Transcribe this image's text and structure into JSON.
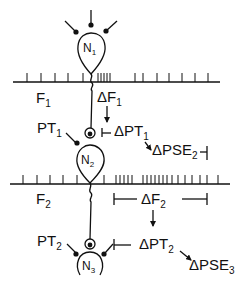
{
  "diagram": {
    "neurons": [
      {
        "id": "N1",
        "letter": "N",
        "sub": "1"
      },
      {
        "id": "N2",
        "letter": "N",
        "sub": "2"
      },
      {
        "id": "N3",
        "letter": "N",
        "sub": "3"
      }
    ],
    "fibers": [
      {
        "id": "F1",
        "letter": "F",
        "sub": "1"
      },
      {
        "id": "F2",
        "letter": "F",
        "sub": "2"
      }
    ],
    "labels": {
      "dF1": {
        "prefix": "ΔF",
        "sub": "1"
      },
      "PT1": {
        "prefix": "PT",
        "sub": "1"
      },
      "dPT1": {
        "prefix": "ΔPT",
        "sub": "1"
      },
      "dPSE2": {
        "prefix": "ΔPSE",
        "sub": "2"
      },
      "dF2": {
        "prefix": "ΔF",
        "sub": "2"
      },
      "PT2": {
        "prefix": "PT",
        "sub": "2"
      },
      "dPT2": {
        "prefix": "ΔPT",
        "sub": "2"
      },
      "dPSE3": {
        "prefix": "ΔPSE",
        "sub": "3"
      }
    },
    "colors": {
      "ink": "#111111",
      "background": "#ffffff"
    }
  }
}
